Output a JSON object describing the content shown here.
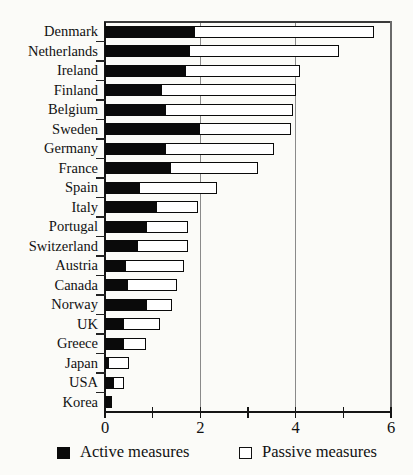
{
  "figure": {
    "background": "#fbfbf8",
    "ink_color": "#0a0a0a"
  },
  "chart_data": {
    "type": "bar",
    "orientation": "horizontal",
    "stacked": true,
    "title": "",
    "xlabel": "",
    "ylabel": "",
    "categories": [
      "Denmark",
      "Netherlands",
      "Ireland",
      "Finland",
      "Belgium",
      "Sweden",
      "Germany",
      "France",
      "Spain",
      "Italy",
      "Portugal",
      "Switzerland",
      "Austria",
      "Canada",
      "Norway",
      "UK",
      "Greece",
      "Japan",
      "USA",
      "Korea"
    ],
    "series": [
      {
        "name": "Active measures",
        "color": "#0a0a0a",
        "values": [
          1.9,
          1.8,
          1.7,
          1.2,
          1.3,
          2.0,
          1.3,
          1.4,
          0.75,
          1.1,
          0.9,
          0.7,
          0.45,
          0.5,
          0.9,
          0.4,
          0.4,
          0.1,
          0.2,
          0.15
        ]
      },
      {
        "name": "Passive measures",
        "color": "#ffffff",
        "values": [
          3.75,
          3.1,
          2.4,
          2.8,
          2.65,
          1.9,
          2.25,
          1.8,
          1.6,
          0.85,
          0.85,
          1.05,
          1.2,
          1.0,
          0.5,
          0.75,
          0.45,
          0.4,
          0.2,
          0.0
        ]
      }
    ],
    "xlim": [
      0,
      6
    ],
    "xticks_labeled": [
      0,
      2,
      4,
      6
    ],
    "xticks_minor": [
      1,
      3,
      5
    ],
    "gridlines_x": [
      2,
      4
    ],
    "grid": "vertical-at-2-and-4",
    "legend_position": "bottom"
  }
}
